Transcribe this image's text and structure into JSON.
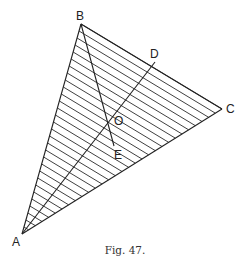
{
  "figure": {
    "caption": "Fig. 47.",
    "points": {
      "A": {
        "label": "A",
        "x": 22,
        "y": 234
      },
      "B": {
        "label": "B",
        "x": 81,
        "y": 24
      },
      "C": {
        "label": "C",
        "x": 222,
        "y": 109
      },
      "D": {
        "label": "D",
        "x": 155,
        "y": 62
      },
      "O": {
        "label": "O",
        "x": 112,
        "y": 123
      },
      "E": {
        "label": "E",
        "x": 114,
        "y": 146
      }
    },
    "segments": [
      [
        "A",
        "B"
      ],
      [
        "A",
        "C"
      ],
      [
        "B",
        "C"
      ],
      [
        "A",
        "D"
      ],
      [
        "B",
        "E"
      ]
    ],
    "hatching": {
      "count": 30,
      "direction": "parallel to BC",
      "color": "#2a2a2a"
    },
    "stroke_color": "#222222"
  }
}
